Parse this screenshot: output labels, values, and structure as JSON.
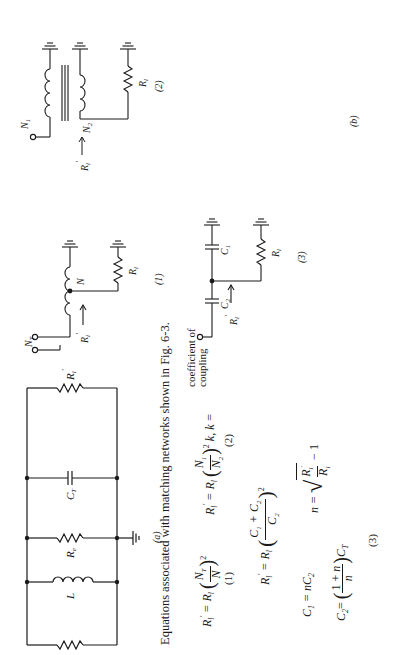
{
  "figure": {
    "panel_a_label": "(a)",
    "panel_b_label": "(b)",
    "circuit_a": {
      "components": [
        "R_o",
        "L",
        "R_e",
        "C_T",
        "R'_l"
      ],
      "labels": {
        "ro": "R",
        "ro_sub": "o",
        "l": "L",
        "re": "R",
        "re_sub": "e",
        "ct": "C",
        "ct_sub": "T",
        "rl": "R",
        "rl_sub": "l",
        "rl_prime": "′"
      }
    },
    "circuit_1": {
      "number": "(1)",
      "nt": "N",
      "nt_sub": "T",
      "n": "N",
      "rl": "R",
      "rl_sub": "l",
      "rin": "R",
      "rin_sub": "l",
      "rin_prime": "′"
    },
    "circuit_2": {
      "number": "(2)",
      "n1": "N",
      "n1_sub": "1",
      "n2": "N",
      "n2_sub": "2",
      "rl": "R",
      "rl_sub": "l",
      "rin": "R",
      "rin_sub": "l",
      "rin_prime": "′"
    },
    "circuit_3": {
      "number": "(3)",
      "c1": "C",
      "c1_sub": "1",
      "c2": "C",
      "c2_sub": "2",
      "rl": "R",
      "rl_sub": "l",
      "rin": "R",
      "rin_sub": "l",
      "rin_prime": "′"
    }
  },
  "equations": {
    "caption": "Equations associated with matching networks shown in Fig. 6-3.",
    "eq1": {
      "text": "R′l = Rl (NT / N)²",
      "number": "(1)"
    },
    "eq2": {
      "text": "R′l = Rl (N1 / N2)² k, k = coefficient of coupling",
      "k_note_1": "coefficient of",
      "k_note_2": "coupling",
      "number": "(2)"
    },
    "eq3": {
      "line1": "R′l = Rl ((C1 + C2) / C2)²",
      "line2a": "C1 = nC2",
      "line2b": "n = √(R′l / Rl) − 1",
      "line3": "C2 = ((1 + n) / n) CT",
      "number": "(3)"
    }
  }
}
